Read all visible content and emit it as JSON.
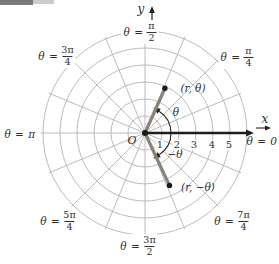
{
  "colors": {
    "background": "#ffffff",
    "grid": "#b3b3b3",
    "axis": "#1f1f1f",
    "ray": "#8a8177",
    "dot": "#1a1a1a",
    "text": "#2e2e2e",
    "artifact_dark": "#7a7a7a",
    "artifact_light": "#cccccc"
  },
  "grid": {
    "center_x": 145,
    "center_y": 133,
    "unit_px": 17,
    "circle_radii_units": [
      1,
      2,
      3,
      4,
      5,
      6
    ],
    "spoke_count": 16,
    "spoke_step_deg": 22.5,
    "spoke_len_px": 104
  },
  "axes": {
    "x_label": "x",
    "y_label": "y",
    "origin_label": "O",
    "x_axis": {
      "y": 133,
      "x_from": 145,
      "x_to": 248,
      "tip_x": 254,
      "label_x": 265,
      "label_y": 119,
      "mini_arrow": {
        "x_from": 256,
        "x_to": 266,
        "tip_x": 271,
        "y": 128
      }
    },
    "y_arrow": {
      "x": 152,
      "y_from": 30,
      "y_to": 11,
      "tip_y": 6,
      "label_x": 141,
      "label_y": 9
    },
    "origin_label_x": 132,
    "origin_label_y": 140,
    "origin_dot_r": 3
  },
  "x_ticks": [
    {
      "text": "1",
      "x": 160,
      "y": 145
    },
    {
      "text": "2",
      "x": 177,
      "y": 145
    },
    {
      "text": "3",
      "x": 194,
      "y": 145
    },
    {
      "text": "4",
      "x": 212,
      "y": 145
    },
    {
      "text": "5",
      "x": 229,
      "y": 145
    }
  ],
  "angle_labels": [
    {
      "name": "angle-label-pi-over-2",
      "prefix": "θ =",
      "numerator": "π",
      "denominator": "2",
      "x": 140,
      "y": 32,
      "boxed": true
    },
    {
      "name": "angle-label-3pi-over-4",
      "prefix": "θ =",
      "numerator": "3π",
      "denominator": "4",
      "x": 56,
      "y": 56,
      "boxed": true
    },
    {
      "name": "angle-label-pi-over-4",
      "prefix": "θ =",
      "numerator": "π",
      "denominator": "4",
      "x": 237,
      "y": 57,
      "boxed": true
    },
    {
      "name": "angle-label-pi",
      "text": "θ = π",
      "x": 20,
      "y": 134,
      "boxed": false
    },
    {
      "name": "angle-label-zero",
      "text": "θ = 0",
      "x": 262,
      "y": 141,
      "boxed": false
    },
    {
      "name": "angle-label-5pi-over-4",
      "prefix": "θ =",
      "numerator": "5π",
      "denominator": "4",
      "x": 58,
      "y": 221,
      "boxed": true
    },
    {
      "name": "angle-label-7pi-over-4",
      "prefix": "θ =",
      "numerator": "7π",
      "denominator": "4",
      "x": 232,
      "y": 221,
      "boxed": true
    },
    {
      "name": "angle-label-3pi-over-2",
      "prefix": "θ =",
      "numerator": "3π",
      "denominator": "2",
      "x": 138,
      "y": 246,
      "boxed": true
    }
  ],
  "points": [
    {
      "name": "r-theta",
      "label": "(r, θ)",
      "angle_deg": 66,
      "r_px": 49,
      "label_x": 193,
      "label_y": 88
    },
    {
      "name": "r-neg-theta",
      "label": "(r, −θ)",
      "angle_deg": -65,
      "r_px": 58,
      "label_x": 198,
      "label_y": 187
    }
  ],
  "angle_arcs": {
    "radius_px": 26,
    "sweep_deg": 57,
    "labels": [
      {
        "text": "θ",
        "x": 176,
        "y": 112
      },
      {
        "text": "−θ",
        "x": 175,
        "y": 154
      }
    ]
  },
  "artifacts": [
    {
      "x": 0,
      "y": 0,
      "w": 33,
      "h": 5,
      "color_key": "artifact_dark"
    },
    {
      "x": 33,
      "y": 0,
      "w": 21,
      "h": 4,
      "color_key": "artifact_light"
    }
  ]
}
